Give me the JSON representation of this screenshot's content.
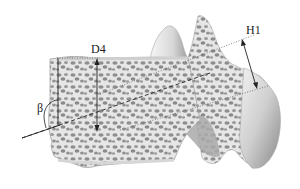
{
  "figure": {
    "labels": {
      "d4": "D4",
      "h1": "H1",
      "beta": "β"
    },
    "colors": {
      "cortex": "#e4e4e4",
      "trabecular_holes": "#8f8f8f",
      "outline": "#9a9a9a",
      "lines": "#333333",
      "shading": "#c8c8c8"
    }
  }
}
